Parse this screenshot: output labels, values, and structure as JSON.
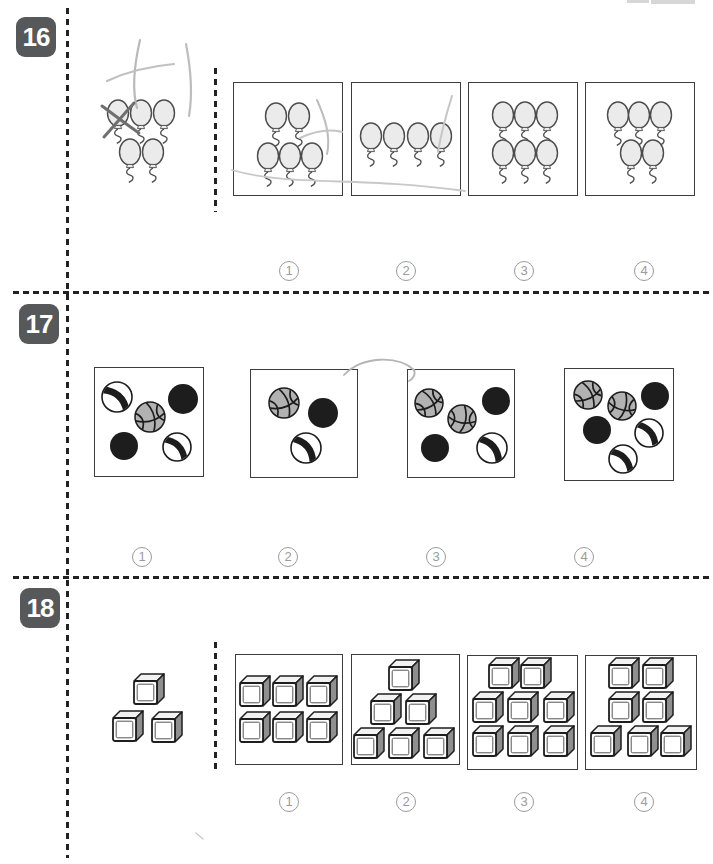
{
  "page": {
    "kind": "counting-worksheet",
    "colors": {
      "badge_bg": "#57585a",
      "badge_text": "#ffffff",
      "circle_number": "#9b9b9b",
      "line": "#222222",
      "pencil_light": "#c0c0c0",
      "pencil_dark": "#6f6f6f",
      "basketball_fill": "#b2b2b2",
      "black_ball": "#1d1d1d",
      "cube_side": "#8f8f8f",
      "balloon_fill": "#ebebeb"
    },
    "problems": [
      {
        "number": "16",
        "item_type": "balloon",
        "stimulus": {
          "item": "balloon",
          "count": 5
        },
        "choices": [
          {
            "value": "1",
            "item": "balloon",
            "count": 5
          },
          {
            "value": "2",
            "item": "balloon",
            "count": 4
          },
          {
            "value": "3",
            "item": "balloon",
            "count": 6
          },
          {
            "value": "4",
            "item": "balloon",
            "count": 5
          }
        ]
      },
      {
        "number": "17",
        "item_type": "ball",
        "choices": [
          {
            "value": "1",
            "count": 5,
            "balls": [
              "beach",
              "black",
              "basketball",
              "black",
              "beach"
            ]
          },
          {
            "value": "2",
            "count": 3,
            "balls": [
              "basketball",
              "black",
              "beach"
            ]
          },
          {
            "value": "3",
            "count": 5,
            "balls": [
              "basketball",
              "basketball",
              "black",
              "black",
              "beach"
            ]
          },
          {
            "value": "4",
            "count": 6,
            "balls": [
              "basketball",
              "basketball",
              "black",
              "black",
              "beach",
              "beach"
            ]
          }
        ]
      },
      {
        "number": "18",
        "item_type": "cube",
        "stimulus": {
          "item": "cube",
          "count": 3
        },
        "choices": [
          {
            "value": "1",
            "item": "cube",
            "count": 6
          },
          {
            "value": "2",
            "item": "cube",
            "count": 6
          },
          {
            "value": "3",
            "item": "cube",
            "count": 8
          },
          {
            "value": "4",
            "item": "cube",
            "count": 7
          }
        ]
      }
    ],
    "annotations": [
      {
        "name": "pencil-scribble-vertical-left",
        "d": "M 140,40 C 134,66 132,90 137,108",
        "w": 2.2,
        "c": "#b9b9b9"
      },
      {
        "name": "pencil-scribble-horizontal",
        "d": "M 107,81 C 128,71 152,66 174,64",
        "w": 2.2,
        "c": "#c0c0c0"
      },
      {
        "name": "pencil-scribble-vertical-right",
        "d": "M 186,44 C 191,70 193,93 189,116",
        "w": 2.2,
        "c": "#bdbdbd"
      },
      {
        "name": "pencil-x-stroke-1",
        "d": "M 102,106 C 113,114 126,124 139,133",
        "w": 3,
        "c": "#6f6f6f"
      },
      {
        "name": "pencil-x-stroke-2",
        "d": "M 134,103 C 124,114 114,126 104,137",
        "w": 3,
        "c": "#6f6f6f"
      },
      {
        "name": "pencil-stroke-choice1-diagonal",
        "d": "M 317,100 C 325,118 331,136 327,154",
        "w": 2,
        "c": "#bdbdbd"
      },
      {
        "name": "pencil-stroke-choice1-arc",
        "d": "M 300,138 C 315,131 330,129 342,132",
        "w": 2,
        "c": "#c4c4c4"
      },
      {
        "name": "pencil-stroke-choice2-diagonal",
        "d": "M 452,96 C 446,115 441,134 438,152",
        "w": 2,
        "c": "#c6c6c6"
      },
      {
        "name": "pencil-long-curve",
        "d": "M 232,170 C 290,187 360,176 465,191",
        "w": 1.8,
        "c": "#c8c8c8"
      },
      {
        "name": "pencil-arc-problem17",
        "d": "M 344,375 C 362,356 398,355 414,370 C 416,374 413,379 409,381",
        "w": 1.8,
        "c": "#b5b5b5"
      },
      {
        "name": "pencil-tick-problem18",
        "d": "M 196,833 L 203,839",
        "w": 1.5,
        "c": "#cccccc"
      }
    ]
  },
  "figures": {
    "p16_stim": {
      "kind": "balloons",
      "w": 130,
      "h": 100,
      "pts": [
        [
          23,
          25
        ],
        [
          46,
          25
        ],
        [
          69,
          25
        ],
        [
          35,
          64
        ],
        [
          58,
          64
        ]
      ]
    },
    "p16_c1": {
      "kind": "balloons",
      "w": 107,
      "h": 111,
      "pts": [
        [
          42,
          33
        ],
        [
          65,
          33
        ],
        [
          34,
          73
        ],
        [
          56,
          73
        ],
        [
          78,
          73
        ]
      ]
    },
    "p16_c2": {
      "kind": "balloons",
      "w": 107,
      "h": 111,
      "pts": [
        [
          19,
          53
        ],
        [
          42,
          53
        ],
        [
          66,
          53
        ],
        [
          89,
          53
        ]
      ]
    },
    "p16_c3": {
      "kind": "balloons",
      "w": 107,
      "h": 111,
      "pts": [
        [
          34,
          32
        ],
        [
          56,
          32
        ],
        [
          78,
          32
        ],
        [
          34,
          70
        ],
        [
          56,
          70
        ],
        [
          78,
          70
        ]
      ]
    },
    "p16_c4": {
      "kind": "balloons",
      "w": 107,
      "h": 111,
      "pts": [
        [
          32,
          32
        ],
        [
          53,
          32
        ],
        [
          75,
          32
        ],
        [
          45,
          70
        ],
        [
          67,
          70
        ]
      ]
    },
    "p17_c1": {
      "kind": "balls",
      "w": 107,
      "h": 107,
      "balls": [
        {
          "t": "beach",
          "x": 22,
          "y": 29,
          "r": 15,
          "a": -50
        },
        {
          "t": "black",
          "x": 88,
          "y": 31,
          "r": 15,
          "a": 0
        },
        {
          "t": "bball",
          "x": 55,
          "y": 49,
          "r": 15,
          "a": -15
        },
        {
          "t": "black",
          "x": 29,
          "y": 78,
          "r": 14,
          "a": 0
        },
        {
          "t": "beach",
          "x": 82,
          "y": 79,
          "r": 14,
          "a": -45
        }
      ]
    },
    "p17_c2": {
      "kind": "balls",
      "w": 105,
      "h": 106,
      "balls": [
        {
          "t": "bball",
          "x": 33,
          "y": 33,
          "r": 15,
          "a": -20
        },
        {
          "t": "black",
          "x": 72,
          "y": 43,
          "r": 15,
          "a": 0
        },
        {
          "t": "beach",
          "x": 55,
          "y": 78,
          "r": 15,
          "a": -40
        }
      ]
    },
    "p17_c3": {
      "kind": "balls",
      "w": 105,
      "h": 106,
      "balls": [
        {
          "t": "bball",
          "x": 21,
          "y": 33,
          "r": 14,
          "a": -30
        },
        {
          "t": "bball",
          "x": 54,
          "y": 49,
          "r": 14,
          "a": 10
        },
        {
          "t": "black",
          "x": 88,
          "y": 31,
          "r": 14,
          "a": 0
        },
        {
          "t": "black",
          "x": 27,
          "y": 78,
          "r": 14,
          "a": 0
        },
        {
          "t": "beach",
          "x": 84,
          "y": 78,
          "r": 15,
          "a": -40
        }
      ]
    },
    "p17_c4": {
      "kind": "balls",
      "w": 107,
      "h": 110,
      "balls": [
        {
          "t": "bball",
          "x": 23,
          "y": 26,
          "r": 14,
          "a": -25
        },
        {
          "t": "bball",
          "x": 57,
          "y": 37,
          "r": 14,
          "a": 15
        },
        {
          "t": "black",
          "x": 90,
          "y": 27,
          "r": 14,
          "a": 0
        },
        {
          "t": "black",
          "x": 32,
          "y": 61,
          "r": 14,
          "a": 0
        },
        {
          "t": "beach",
          "x": 84,
          "y": 64,
          "r": 14,
          "a": -40
        },
        {
          "t": "beach",
          "x": 58,
          "y": 90,
          "r": 14,
          "a": -45
        }
      ]
    },
    "p18_stim": {
      "kind": "cubes",
      "w": 85,
      "h": 85,
      "pts": [
        [
          29,
          11
        ],
        [
          8,
          48
        ],
        [
          47,
          49
        ]
      ]
    },
    "p18_c1": {
      "kind": "cubes",
      "w": 105,
      "h": 108,
      "pts": [
        [
          4,
          28
        ],
        [
          37,
          28
        ],
        [
          71,
          28
        ],
        [
          4,
          64
        ],
        [
          37,
          64
        ],
        [
          71,
          64
        ]
      ]
    },
    "p18_c2": {
      "kind": "cubes",
      "w": 106,
      "h": 108,
      "pts": [
        [
          37,
          12
        ],
        [
          19,
          46
        ],
        [
          54,
          46
        ],
        [
          2,
          80
        ],
        [
          37,
          80
        ],
        [
          72,
          80
        ]
      ]
    },
    "p18_c3": {
      "kind": "cubes",
      "w": 108,
      "h": 112,
      "pts": [
        [
          21,
          9
        ],
        [
          53,
          9
        ],
        [
          5,
          43
        ],
        [
          40,
          43
        ],
        [
          76,
          43
        ],
        [
          5,
          77
        ],
        [
          40,
          77
        ],
        [
          76,
          77
        ]
      ]
    },
    "p18_c4": {
      "kind": "cubes",
      "w": 109,
      "h": 112,
      "pts": [
        [
          23,
          9
        ],
        [
          57,
          9
        ],
        [
          23,
          43
        ],
        [
          57,
          43
        ],
        [
          5,
          77
        ],
        [
          42,
          77
        ],
        [
          75,
          77
        ]
      ]
    }
  }
}
